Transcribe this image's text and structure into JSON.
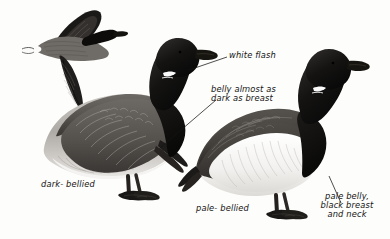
{
  "plate": {
    "title": "Brent Goose identification plate",
    "background_color": "#fdfdfb",
    "ink_color": "#141414",
    "figures": [
      {
        "name": "flying-brent-goose",
        "pose": "in flight, left profile",
        "plumage": "dark-bellied",
        "features": [
          "black head and neck",
          "white neck flash",
          "dark grey wings",
          "white tail coverts",
          "dark belly"
        ]
      },
      {
        "name": "dark-bellied-brent-goose",
        "pose": "standing, left profile",
        "plumage": "dark-bellied",
        "features": [
          "black head and neck",
          "white neck flash",
          "scalloped grey-brown wing",
          "grey belly almost as dark as breast",
          "white vent",
          "black legs and webbed feet"
        ]
      },
      {
        "name": "pale-bellied-brent-goose",
        "pose": "standing, left profile",
        "plumage": "pale-bellied",
        "features": [
          "black head and neck",
          "white neck flash",
          "dark brown wing",
          "white pale belly",
          "black breast",
          "black legs and webbed feet"
        ]
      }
    ],
    "labels": {
      "white_flash": "white flash",
      "belly_dark_line1": "belly almost as",
      "belly_dark_line2": "dark as breast",
      "dark_bellied": "dark- bellied",
      "pale_bellied": "pale- bellied",
      "pale_belly_line1": "pale belly,",
      "pale_belly_line2": "black breast",
      "pale_belly_line3": "and neck"
    },
    "leader_lines": [
      {
        "name": "leader-white-flash",
        "from": "white flash label",
        "to": "neck of dark-bellied goose"
      },
      {
        "name": "leader-belly-dark",
        "from": "belly almost as dark as breast label",
        "to": "belly of dark-bellied goose"
      },
      {
        "name": "leader-pale-belly",
        "from": "pale belly black breast and neck label",
        "to": "flank of pale-bellied goose"
      }
    ]
  }
}
